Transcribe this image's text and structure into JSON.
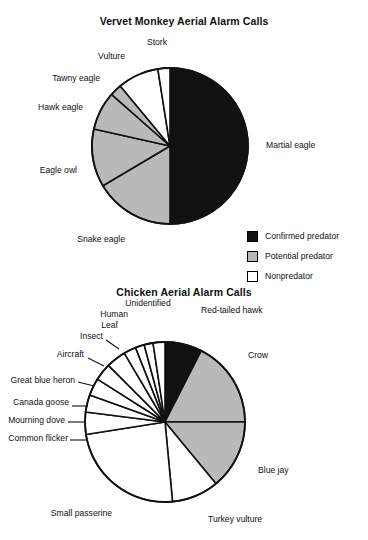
{
  "figure": {
    "panels": [
      {
        "id": "vervet",
        "title": "Vervet Monkey Aerial Alarm Calls"
      },
      {
        "id": "chicken",
        "title": "Chicken Aerial Alarm Calls"
      }
    ]
  },
  "legend": {
    "items": [
      {
        "label": "Confirmed predator",
        "color": "#111111",
        "swatch": "sw-black"
      },
      {
        "label": "Potential predator",
        "color": "#b9b9b9",
        "swatch": "sw-gray"
      },
      {
        "label": "Nonpredator",
        "color": "#ffffff",
        "swatch": "sw-white"
      }
    ]
  },
  "chart_data": [
    {
      "type": "pie",
      "title": "Vervet Monkey Aerial Alarm Calls",
      "xlabel": "",
      "ylabel": "",
      "legend_position": "bottom-right",
      "grid": false,
      "start_angle_deg": 0,
      "direction": "clockwise",
      "categories": [
        "Martial eagle",
        "Snake eagle",
        "Eagle owl",
        "Hawk eagle",
        "Tawny eagle",
        "Vulture",
        "Stork"
      ],
      "values": [
        50.0,
        16.5,
        12.0,
        8.0,
        2.5,
        8.5,
        2.5
      ],
      "units": "percent of calls",
      "slice_colors": [
        "#111111",
        "#b9b9b9",
        "#b9b9b9",
        "#b9b9b9",
        "#b9b9b9",
        "#ffffff",
        "#ffffff"
      ],
      "slice_classes": [
        "Confirmed predator",
        "Potential predator",
        "Potential predator",
        "Potential predator",
        "Potential predator",
        "Nonpredator",
        "Nonpredator"
      ],
      "labels": [
        {
          "text": "Martial eagle",
          "anchor": "left"
        },
        {
          "text": "Snake eagle",
          "anchor": "right"
        },
        {
          "text": "Eagle owl",
          "anchor": "right"
        },
        {
          "text": "Hawk eagle",
          "anchor": "right"
        },
        {
          "text": "Tawny eagle",
          "anchor": "right"
        },
        {
          "text": "Vulture",
          "anchor": "right"
        },
        {
          "text": "Stork",
          "anchor": "center"
        }
      ]
    },
    {
      "type": "pie",
      "title": "Chicken Aerial Alarm Calls",
      "xlabel": "",
      "ylabel": "",
      "legend_position": "shared-with-panel-1",
      "grid": false,
      "start_angle_deg": 0,
      "direction": "clockwise",
      "categories": [
        "Red-tailed hawk",
        "Crow",
        "Blue jay",
        "Turkey vulture",
        "Small passerine",
        "Common flicker",
        "Mourning dove",
        "Canada goose",
        "Great blue heron",
        "Aircraft",
        "Insect",
        "Leaf",
        "Human",
        "Unidentified"
      ],
      "values": [
        7.5,
        17.5,
        14.0,
        9.5,
        24.0,
        4.5,
        3.5,
        3.5,
        3.5,
        4.0,
        2.5,
        1.8,
        1.8,
        2.4
      ],
      "units": "percent of calls",
      "slice_colors": [
        "#111111",
        "#b9b9b9",
        "#b9b9b9",
        "#ffffff",
        "#ffffff",
        "#ffffff",
        "#ffffff",
        "#ffffff",
        "#ffffff",
        "#ffffff",
        "#ffffff",
        "#ffffff",
        "#ffffff",
        "#ffffff"
      ],
      "slice_classes": [
        "Confirmed predator",
        "Potential predator",
        "Potential predator",
        "Nonpredator",
        "Nonpredator",
        "Nonpredator",
        "Nonpredator",
        "Nonpredator",
        "Nonpredator",
        "Nonpredator",
        "Nonpredator",
        "Nonpredator",
        "Nonpredator",
        "Nonpredator"
      ],
      "labels": [
        {
          "text": "Red-tailed hawk",
          "anchor": "left"
        },
        {
          "text": "Crow",
          "anchor": "left"
        },
        {
          "text": "Blue jay",
          "anchor": "left"
        },
        {
          "text": "Turkey vulture",
          "anchor": "left"
        },
        {
          "text": "Small passerine",
          "anchor": "right"
        },
        {
          "text": "Common flicker",
          "anchor": "right"
        },
        {
          "text": "Mourning dove",
          "anchor": "right"
        },
        {
          "text": "Canada goose",
          "anchor": "right"
        },
        {
          "text": "Great blue heron",
          "anchor": "right"
        },
        {
          "text": "Aircraft",
          "anchor": "right"
        },
        {
          "text": "Insect",
          "anchor": "right"
        },
        {
          "text": "Leaf",
          "anchor": "right"
        },
        {
          "text": "Human",
          "anchor": "right"
        },
        {
          "text": "Unidentified",
          "anchor": "center"
        }
      ]
    }
  ]
}
